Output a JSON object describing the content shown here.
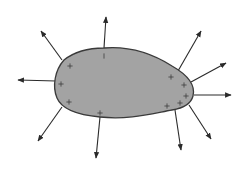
{
  "diagram": {
    "colors": {
      "background": "#ffffff",
      "region_fill": "#a3a3a3",
      "region_stroke": "#3a3a3a",
      "arrow": "#2a2a2a",
      "charge": "#3c3c3c"
    },
    "region": {
      "path": "M 104 48 C 128 46, 150 52, 172 66 C 186 74, 196 84, 193 96 C 191 104, 184 108, 172 110 C 150 114, 128 120, 100 117 C 78 115, 62 110, 57 98 C 52 86, 55 70, 64 60 C 74 52, 88 48, 104 48 Z"
    },
    "arrows": [
      {
        "id": "normal-upper-left",
        "x1": 62,
        "y1": 60,
        "x2": 41,
        "y2": 31
      },
      {
        "id": "normal-top",
        "x1": 104,
        "y1": 48,
        "x2": 106,
        "y2": 17
      },
      {
        "id": "normal-left",
        "x1": 56,
        "y1": 81,
        "x2": 18,
        "y2": 80
      },
      {
        "id": "normal-upper-right",
        "x1": 178,
        "y1": 71,
        "x2": 201,
        "y2": 31
      },
      {
        "id": "normal-right-upper",
        "x1": 191,
        "y1": 82,
        "x2": 226,
        "y2": 63
      },
      {
        "id": "normal-right",
        "x1": 194,
        "y1": 95,
        "x2": 231,
        "y2": 95
      },
      {
        "id": "normal-lower-right",
        "x1": 189,
        "y1": 105,
        "x2": 211,
        "y2": 139
      },
      {
        "id": "normal-lower",
        "x1": 175,
        "y1": 110,
        "x2": 181,
        "y2": 150
      },
      {
        "id": "normal-lower-left",
        "x1": 62,
        "y1": 107,
        "x2": 38,
        "y2": 141
      },
      {
        "id": "normal-bottom",
        "x1": 100,
        "y1": 117,
        "x2": 96,
        "y2": 158
      }
    ],
    "charges": [
      {
        "symbol": "+",
        "x": 70,
        "y": 66
      },
      {
        "symbol": "+",
        "x": 61,
        "y": 84
      },
      {
        "symbol": "+",
        "x": 69,
        "y": 102
      },
      {
        "symbol": "+",
        "x": 100,
        "y": 113
      },
      {
        "symbol": "+",
        "x": 171,
        "y": 77
      },
      {
        "symbol": "+",
        "x": 184,
        "y": 85
      },
      {
        "symbol": "+",
        "x": 186,
        "y": 96
      },
      {
        "symbol": "+",
        "x": 180,
        "y": 103
      },
      {
        "symbol": "+",
        "x": 167,
        "y": 106
      },
      {
        "symbol": "|",
        "x": 104,
        "y": 56
      }
    ]
  }
}
